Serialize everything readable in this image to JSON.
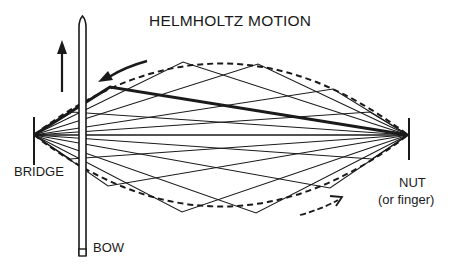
{
  "title": "HELMHOLTZ MOTION",
  "labels": {
    "bridge": "BRIDGE",
    "bow": "BOW",
    "nut": "NUT",
    "nut_sub": "(or finger)"
  },
  "colors": {
    "ink": "#1a1a1a",
    "background": "#ffffff"
  },
  "diagram": {
    "bridge_point": [
      34,
      135
    ],
    "nut_point": [
      408,
      135
    ],
    "envelope": {
      "style": "dashed",
      "top_control": [
        221,
        30
      ],
      "bottom_control": [
        221,
        240
      ]
    },
    "kink_points_top": [
      [
        110,
        87
      ],
      [
        183,
        62
      ],
      [
        258,
        64
      ],
      [
        333,
        89
      ]
    ],
    "kink_points_bottom": [
      [
        108,
        186
      ],
      [
        182,
        212
      ],
      [
        256,
        213
      ],
      [
        330,
        188
      ]
    ],
    "highlighted_kink": [
      110,
      87
    ],
    "bow": {
      "x": 82,
      "top": 20,
      "bottom": 256
    },
    "arrows": {
      "bow_motion": "up",
      "kink_top_direction": "left",
      "kink_bottom_direction": "right"
    }
  }
}
